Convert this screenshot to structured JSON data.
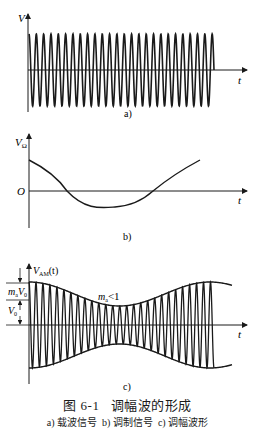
{
  "figure": {
    "number": "图 6-1",
    "title": "调幅波的形成",
    "subcaptions": [
      {
        "tag": "a)",
        "text": "载波信号"
      },
      {
        "tag": "b)",
        "text": "调制信号"
      },
      {
        "tag": "c)",
        "text": "调幅波形"
      }
    ]
  },
  "panels": {
    "a": {
      "label": "a)",
      "y_axis": "V",
      "x_axis": "t"
    },
    "b": {
      "label": "b)",
      "y_axis": "V",
      "y_axis_sub": "Ω",
      "x_axis": "t",
      "origin": "O"
    },
    "c": {
      "label": "c)",
      "y_axis": "V",
      "y_axis_sub": "AM",
      "y_axis_suffix": "(t)",
      "x_axis": "t",
      "annotation": "m",
      "annotation_sub": "a",
      "annotation_rel": "<1",
      "dim_top": "m",
      "dim_top_sub": "a",
      "dim_top_var": "V",
      "dim_top_var_sub": "0",
      "dim_bottom": "V",
      "dim_bottom_sub": "0"
    }
  },
  "chart_data": [
    {
      "type": "line",
      "title": "a) 载波信号",
      "xlabel": "t",
      "ylabel": "V",
      "description": "Constant-amplitude high-frequency carrier sinusoid, ~25 cycles",
      "amplitude": 1,
      "cycles": 25
    },
    {
      "type": "line",
      "title": "b) 调制信号",
      "xlabel": "t",
      "ylabel": "VΩ",
      "description": "Low-frequency modulating signal, starts positive, crosses zero, minimum, rises again",
      "x": [
        0,
        0.22,
        0.5,
        0.72,
        1.0
      ],
      "y": [
        0.7,
        0,
        -0.35,
        0,
        0.7
      ]
    },
    {
      "type": "line",
      "title": "c) 调幅波形",
      "xlabel": "t",
      "ylabel": "VAM(t)",
      "description": "Amplitude-modulated carrier with envelope following modulating signal, ma<1",
      "annotations": [
        "maV0",
        "V0",
        "ma<1"
      ]
    }
  ]
}
